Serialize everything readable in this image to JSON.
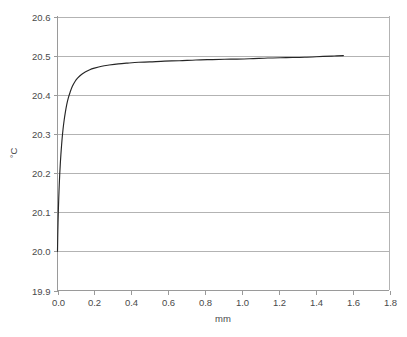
{
  "chart_data": {
    "type": "line",
    "title": "",
    "subtitle": "",
    "xlabel": "mm",
    "ylabel": "°C",
    "xlim": [
      0.0,
      1.8
    ],
    "ylim": [
      19.9,
      20.6
    ],
    "grid": "horizontal",
    "legend": "none",
    "x_ticks": [
      "0.0",
      "0.2",
      "0.4",
      "0.6",
      "0.8",
      "1.0",
      "1.2",
      "1.4",
      "1.6",
      "1.8"
    ],
    "x_tick_values": [
      0.0,
      0.2,
      0.4,
      0.6,
      0.8,
      1.0,
      1.2,
      1.4,
      1.6,
      1.8
    ],
    "y_ticks": [
      "19.9",
      "20.0",
      "20.1",
      "20.2",
      "20.3",
      "20.4",
      "20.5",
      "20.6"
    ],
    "y_tick_values": [
      19.9,
      20.0,
      20.1,
      20.2,
      20.3,
      20.4,
      20.5,
      20.6
    ],
    "series": [
      {
        "name": "temperature-profile",
        "color": "#262626",
        "x": [
          0.0,
          0.002,
          0.005,
          0.008,
          0.012,
          0.016,
          0.02,
          0.025,
          0.03,
          0.036,
          0.042,
          0.05,
          0.058,
          0.068,
          0.08,
          0.095,
          0.11,
          0.13,
          0.15,
          0.175,
          0.2,
          0.24,
          0.28,
          0.33,
          0.38,
          0.44,
          0.5,
          0.58,
          0.66,
          0.75,
          0.84,
          0.94,
          1.04,
          1.14,
          1.24,
          1.34,
          1.44,
          1.5,
          1.55
        ],
        "y": [
          20.0,
          20.055,
          20.11,
          20.152,
          20.196,
          20.23,
          20.258,
          20.288,
          20.312,
          20.335,
          20.354,
          20.375,
          20.391,
          20.406,
          20.421,
          20.434,
          20.443,
          20.452,
          20.458,
          20.464,
          20.468,
          20.473,
          20.476,
          20.479,
          20.481,
          20.483,
          20.484,
          20.486,
          20.487,
          20.489,
          20.49,
          20.491,
          20.492,
          20.494,
          20.495,
          20.496,
          20.498,
          20.499,
          20.5
        ]
      }
    ],
    "annotations": []
  },
  "axis": {
    "x_title": "mm",
    "y_title": "°C"
  }
}
